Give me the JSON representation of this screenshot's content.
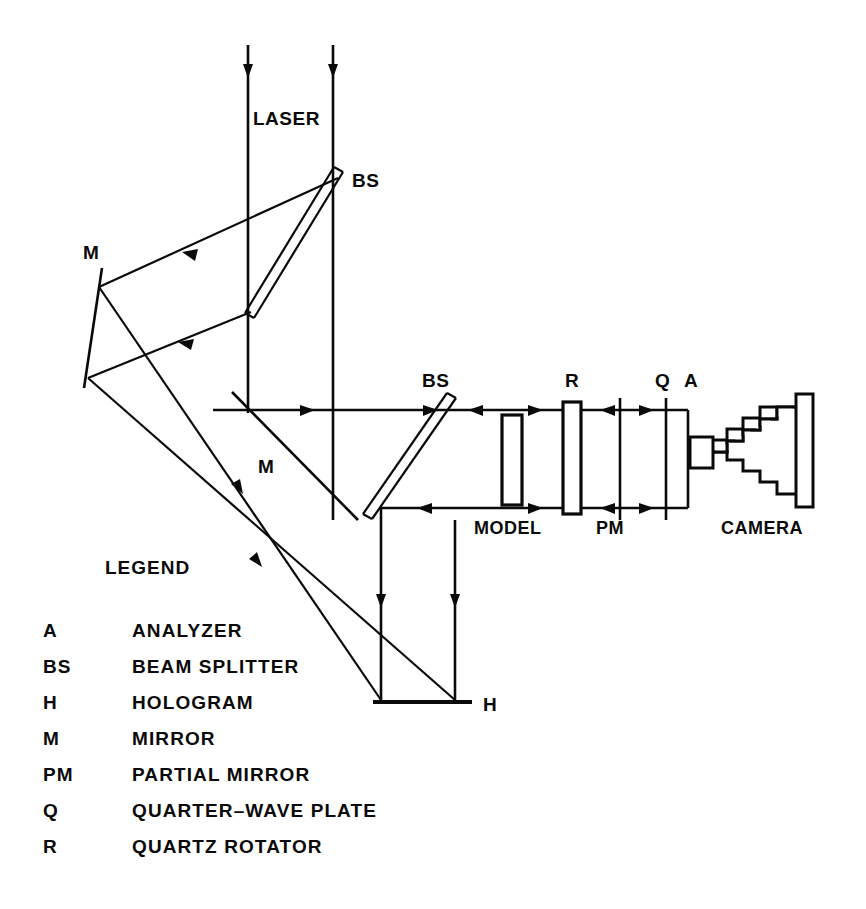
{
  "figure": {
    "kind": "optical-schematic",
    "background_color": "#ffffff",
    "ink_color": "#0a0a0a",
    "width": 866,
    "height": 909
  },
  "labels": {
    "laser": "LASER",
    "bs_top": "BS",
    "bs_mid": "BS",
    "mirror_left": "M",
    "mirror_mid": "M",
    "hologram": "H",
    "model": "MODEL",
    "partial_mirror": "PM",
    "quartz_rotator": "R",
    "quarter_wave": "Q",
    "analyzer": "A",
    "camera": "CAMERA"
  },
  "legend": {
    "title": "LEGEND",
    "entries": [
      {
        "key": "A",
        "value": "ANALYZER"
      },
      {
        "key": "BS",
        "value": "BEAM  SPLITTER"
      },
      {
        "key": "H",
        "value": "HOLOGRAM"
      },
      {
        "key": "M",
        "value": "MIRROR"
      },
      {
        "key": "PM",
        "value": "PARTIAL  MIRROR"
      },
      {
        "key": "Q",
        "value": "QUARTER–WAVE   PLATE"
      },
      {
        "key": "R",
        "value": "QUARTZ   ROTATOR"
      }
    ]
  },
  "components": {
    "beam_splitter_top": {
      "name": "beam-splitter",
      "symbol": "BS"
    },
    "beam_splitter_mid": {
      "name": "beam-splitter",
      "symbol": "BS"
    },
    "mirror_left": {
      "name": "mirror",
      "symbol": "M"
    },
    "mirror_mid": {
      "name": "mirror",
      "symbol": "M"
    },
    "hologram_plate": {
      "name": "hologram",
      "symbol": "H"
    },
    "model_plate": {
      "name": "model",
      "symbol": "MODEL"
    },
    "rotator_plate": {
      "name": "quartz-rotator",
      "symbol": "R"
    },
    "partial_mirror_line": {
      "name": "partial-mirror",
      "symbol": "PM"
    },
    "quarter_wave_line": {
      "name": "quarter-wave-plate",
      "symbol": "Q"
    },
    "analyzer_line": {
      "name": "analyzer",
      "symbol": "A"
    },
    "camera_body": {
      "name": "camera",
      "symbol": "CAMERA"
    }
  }
}
